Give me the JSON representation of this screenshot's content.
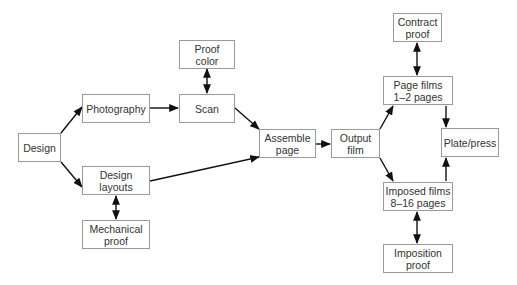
{
  "diagram": {
    "type": "flowchart",
    "nodes": {
      "design": {
        "lines": [
          "Design"
        ]
      },
      "photography": {
        "lines": [
          "Photography"
        ]
      },
      "scan": {
        "lines": [
          "Scan"
        ]
      },
      "proof_color": {
        "lines": [
          "Proof",
          "color"
        ]
      },
      "design_layouts": {
        "lines": [
          "Design",
          "layouts"
        ]
      },
      "mechanical_proof": {
        "lines": [
          "Mechanical",
          "proof"
        ]
      },
      "assemble_page": {
        "lines": [
          "Assemble",
          "page"
        ]
      },
      "output_film": {
        "lines": [
          "Output",
          "film"
        ]
      },
      "contract_proof": {
        "lines": [
          "Contract",
          "proof"
        ]
      },
      "page_films": {
        "lines": [
          "Page films",
          "1–2 pages"
        ]
      },
      "plate_press": {
        "lines": [
          "Plate/press"
        ]
      },
      "imposed_films": {
        "lines": [
          "Imposed films",
          "8–16 pages"
        ]
      },
      "imposition_proof": {
        "lines": [
          "Imposition",
          "proof"
        ]
      }
    },
    "edges": [
      {
        "from": "design",
        "to": "photography",
        "direction": "forward"
      },
      {
        "from": "design",
        "to": "design_layouts",
        "direction": "forward"
      },
      {
        "from": "photography",
        "to": "scan",
        "direction": "forward"
      },
      {
        "from": "proof_color",
        "to": "scan",
        "direction": "both"
      },
      {
        "from": "scan",
        "to": "assemble_page",
        "direction": "forward"
      },
      {
        "from": "design_layouts",
        "to": "assemble_page",
        "direction": "forward"
      },
      {
        "from": "design_layouts",
        "to": "mechanical_proof",
        "direction": "both"
      },
      {
        "from": "assemble_page",
        "to": "output_film",
        "direction": "forward"
      },
      {
        "from": "output_film",
        "to": "page_films",
        "direction": "forward"
      },
      {
        "from": "output_film",
        "to": "imposed_films",
        "direction": "forward"
      },
      {
        "from": "contract_proof",
        "to": "page_films",
        "direction": "both"
      },
      {
        "from": "page_films",
        "to": "plate_press",
        "direction": "forward"
      },
      {
        "from": "imposed_films",
        "to": "plate_press",
        "direction": "forward"
      },
      {
        "from": "imposed_films",
        "to": "imposition_proof",
        "direction": "both"
      }
    ],
    "colors": {
      "border": "#9a9a9a",
      "text": "#333333",
      "arrow": "#111111",
      "background": "#ffffff"
    }
  }
}
